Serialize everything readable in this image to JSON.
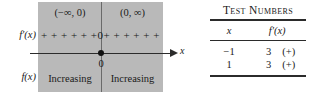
{
  "sign_chart": {
    "intervals": [
      {
        "label": "(−∞, 0)"
      },
      {
        "label": "(0, ∞)"
      }
    ],
    "row_labels": {
      "derivative": "f′(x)",
      "function": "f(x)"
    },
    "signs": {
      "left": "+ + + + + +",
      "critical_value": "0",
      "right": "+ + + + + +"
    },
    "axis": {
      "variable_label": "x",
      "critical_point_label": "0"
    },
    "behavior": [
      {
        "label": "Increasing"
      },
      {
        "label": "Increasing"
      }
    ],
    "panel_color": "#b9b9b9"
  },
  "test_numbers": {
    "title": "Test Numbers",
    "columns": [
      "x",
      "f′(x)"
    ],
    "rows": [
      {
        "x": "−1",
        "value": "3",
        "sign": "(+)"
      },
      {
        "x": "1",
        "value": "3",
        "sign": "(+)"
      }
    ]
  }
}
